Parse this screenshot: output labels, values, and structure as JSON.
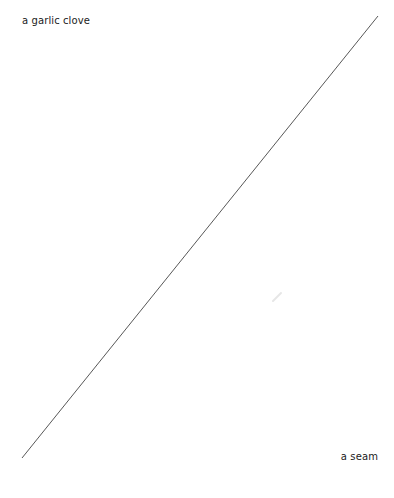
{
  "diagram": {
    "type": "line-connector",
    "start_label": "a garlic clove",
    "end_label": "a seam",
    "line": {
      "x1": 378,
      "y1": 16,
      "x2": 22,
      "y2": 458,
      "color": "#444444",
      "width": 0.9
    },
    "smudge": {
      "x": 277,
      "y": 297,
      "color": "#e8e8e8"
    }
  }
}
